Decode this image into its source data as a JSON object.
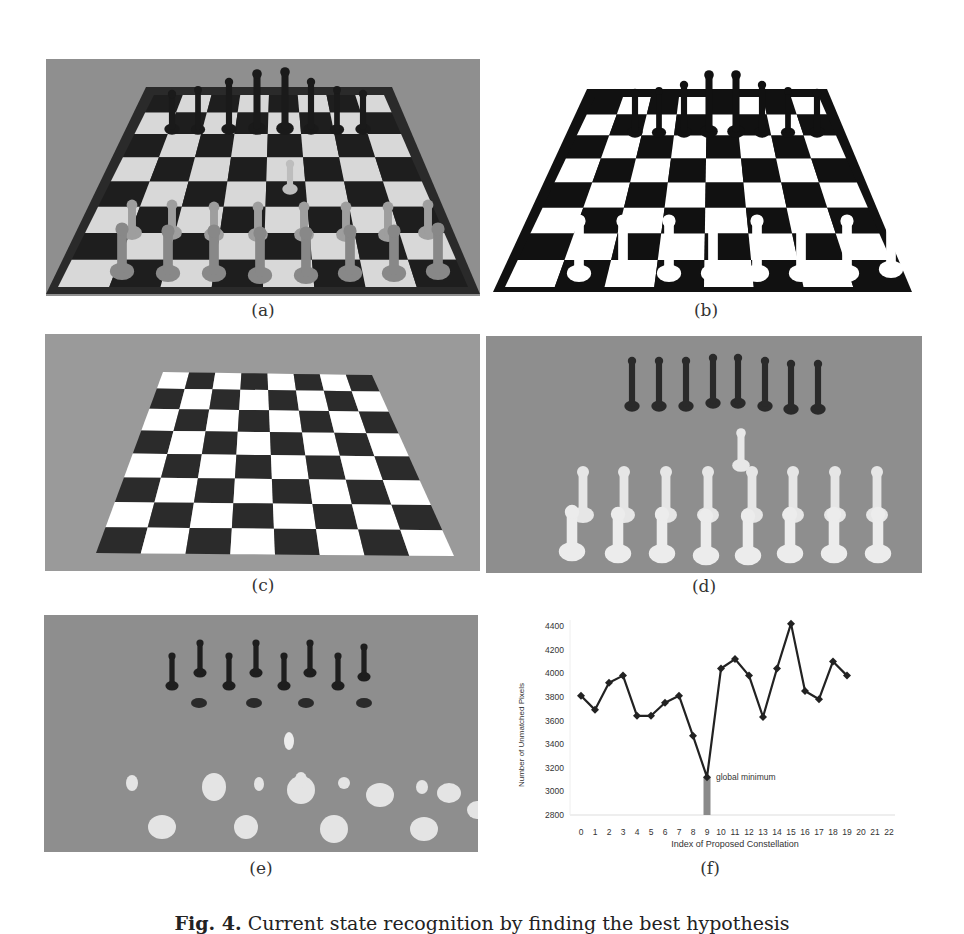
{
  "figure": {
    "caption_label": "Fig. 4.",
    "caption_text": "Current state recognition by finding the best hypothesis",
    "panels": [
      {
        "id": "a",
        "label": "(a)",
        "description": "camera image of chessboard with pieces"
      },
      {
        "id": "b",
        "label": "(b)",
        "description": "binarized image"
      },
      {
        "id": "c",
        "label": "(c)",
        "description": "rendered empty chessboard model"
      },
      {
        "id": "d",
        "label": "(d)",
        "description": "rendered piece hypothesis"
      },
      {
        "id": "e",
        "label": "(e)",
        "description": "difference / unmatched pixels"
      },
      {
        "id": "f",
        "label": "(f)",
        "description": "unmatched pixels per constellation"
      }
    ]
  },
  "chart_data": {
    "type": "line",
    "title": "",
    "xlabel": "Index of Proposed Constellation",
    "ylabel": "Number of Unmatched Pixels",
    "x": [
      0,
      1,
      2,
      3,
      4,
      5,
      6,
      7,
      8,
      9,
      10,
      11,
      12,
      13,
      14,
      15,
      16,
      17,
      18,
      19
    ],
    "x_ticks": [
      "0",
      "1",
      "2",
      "3",
      "4",
      "5",
      "6",
      "7",
      "8",
      "9",
      "10",
      "11",
      "12",
      "13",
      "14",
      "15",
      "16",
      "17",
      "18",
      "19",
      "20",
      "21",
      "22"
    ],
    "y_ticks": [
      "4400",
      "4200",
      "4000",
      "3800",
      "3600",
      "3400",
      "3200",
      "3000",
      "2800"
    ],
    "series": [
      {
        "name": "Unmatched pixels",
        "values": [
          3810,
          3690,
          3920,
          3980,
          3640,
          3640,
          3750,
          3810,
          3470,
          3120,
          4040,
          4120,
          3980,
          3630,
          4040,
          4420,
          3850,
          3780,
          4100,
          3980
        ]
      }
    ],
    "ylim": [
      2800,
      4400
    ],
    "xlim": [
      0,
      22
    ],
    "grid": false,
    "legend": null,
    "annotations": [
      {
        "x": 9,
        "y": 3120,
        "text": "global minimum",
        "marker": "bar"
      }
    ]
  }
}
